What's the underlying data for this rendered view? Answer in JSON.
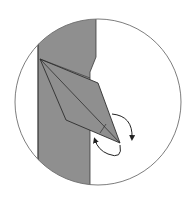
{
  "diagram": {
    "type": "origami-step-detail",
    "colors": {
      "background": "#ffffff",
      "paper": "#8f8f8f",
      "outline": "#3a3a3a",
      "circle": "#6e6e6e",
      "arrow": "#222222"
    },
    "circle": {
      "cx": 98,
      "cy": 102,
      "r": 83
    },
    "strip_path": "M40,42 L96,17 L96,57 L90,72 L90,184 L60,172 L38,158 Z",
    "flap": {
      "outline_points": "40,59 98,83 120,143 66,120",
      "crease_main": {
        "x1": 40,
        "y1": 59,
        "x2": 120,
        "y2": 143
      },
      "crease_tip": {
        "x1": 106,
        "y1": 124,
        "x2": 100,
        "y2": 133
      }
    },
    "arrows": [
      {
        "name": "fold-forward-arrow",
        "path": "M112,114 Q133,116 132,138"
      },
      {
        "name": "fold-back-arrow",
        "path": "M120,145 Q123,160 108,154 Q98,150 95,140"
      }
    ]
  }
}
